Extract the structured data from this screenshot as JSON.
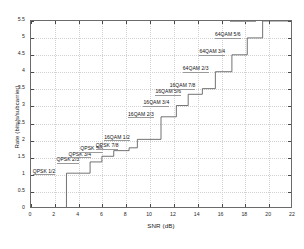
{
  "chart_data": {
    "type": "line",
    "title": "",
    "xlabel": "SNR (dB)",
    "ylabel": "Rate (bits/s/subcarrier)",
    "xlim": [
      0,
      22
    ],
    "ylim": [
      0,
      5.5
    ],
    "xticks": [
      0,
      2,
      4,
      6,
      8,
      10,
      12,
      14,
      16,
      18,
      20,
      22
    ],
    "xtick_labels": [
      "0",
      "2",
      "4",
      "6",
      "8",
      "10",
      "12",
      "14",
      "16",
      "18",
      "20",
      "22"
    ],
    "yticks": [
      0,
      0.5,
      1,
      1.5,
      2,
      2.5,
      3,
      3.5,
      4,
      4.5,
      5,
      5.5
    ],
    "ytick_labels": [
      "0",
      "0.5",
      "1",
      "1.5",
      "2",
      "2.5",
      "3",
      "3.5",
      "4",
      "4.5",
      "5",
      "5.5"
    ],
    "grid": true,
    "legend": "none",
    "drawstyle": "steps-post",
    "series": [
      {
        "name": "Adaptive MCS rate",
        "x": [
          3.0,
          5.0,
          6.0,
          7.0,
          8.3,
          9.0,
          11.0,
          12.3,
          13.3,
          14.5,
          15.6,
          17.0,
          18.3,
          19.6
        ],
        "y": [
          1.0,
          1.333,
          1.5,
          1.667,
          1.75,
          2.0,
          2.667,
          3.0,
          3.333,
          3.5,
          4.0,
          4.5,
          5.0,
          5.5
        ]
      }
    ],
    "annotations": [
      {
        "label": "QPSK 1/2",
        "x": 3.0,
        "y": 1.0,
        "modulation": "QPSK",
        "code_rate": "1/2"
      },
      {
        "label": "QPSK 2/3",
        "x": 5.0,
        "y": 1.333,
        "modulation": "QPSK",
        "code_rate": "2/3"
      },
      {
        "label": "QPSK 3/4",
        "x": 6.0,
        "y": 1.5,
        "modulation": "QPSK",
        "code_rate": "3/4"
      },
      {
        "label": "QPSK 5/6",
        "x": 7.0,
        "y": 1.667,
        "modulation": "QPSK",
        "code_rate": "5/6"
      },
      {
        "label": "QPSK 7/8",
        "x": 8.3,
        "y": 1.75,
        "modulation": "QPSK",
        "code_rate": "7/8"
      },
      {
        "label": "16QAM 1/2",
        "x": 9.0,
        "y": 2.0,
        "modulation": "16QAM",
        "code_rate": "1/2"
      },
      {
        "label": "16QAM 2/3",
        "x": 11.0,
        "y": 2.667,
        "modulation": "16QAM",
        "code_rate": "2/3"
      },
      {
        "label": "16QAM 3/4",
        "x": 12.3,
        "y": 3.0,
        "modulation": "16QAM",
        "code_rate": "3/4"
      },
      {
        "label": "16QAM 5/6",
        "x": 13.3,
        "y": 3.333,
        "modulation": "16QAM",
        "code_rate": "5/6"
      },
      {
        "label": "16QAM 7/8",
        "x": 14.5,
        "y": 3.5,
        "modulation": "16QAM",
        "code_rate": "7/8"
      },
      {
        "label": "64QAM 2/3",
        "x": 15.6,
        "y": 4.0,
        "modulation": "64QAM",
        "code_rate": "2/3"
      },
      {
        "label": "64QAM 3/4",
        "x": 17.0,
        "y": 4.5,
        "modulation": "64QAM",
        "code_rate": "3/4"
      },
      {
        "label": "64QAM 5/6",
        "x": 18.3,
        "y": 5.0,
        "modulation": "64QAM",
        "code_rate": "5/6"
      },
      {
        "label": "64QAM 7/8",
        "x": 19.6,
        "y": 5.5,
        "modulation": "64QAM",
        "code_rate": "7/8"
      }
    ],
    "colors": {
      "line": "#4d4d4d",
      "axis": "#6b6b6b",
      "grid": "#d2d2d2",
      "text": "#1a1a1a",
      "background": "#ffffff"
    }
  }
}
